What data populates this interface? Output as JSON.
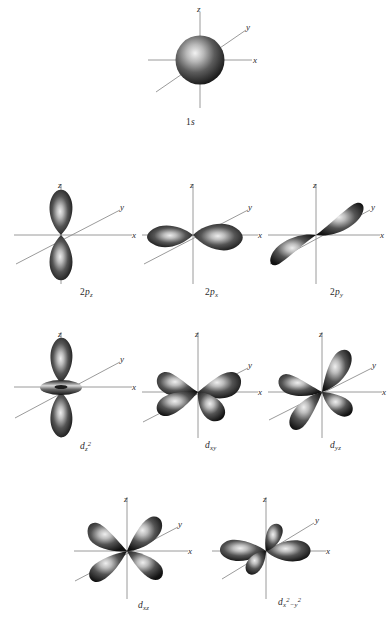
{
  "figure": {
    "background_color": "#ffffff",
    "axis_color": "#8a8a8a",
    "lobe_dark": "#1b1b1b",
    "lobe_mid": "#4a4a4a",
    "lobe_light": "#e8e8e8",
    "axis_labels": {
      "x": "x",
      "y": "y",
      "z": "z"
    }
  },
  "rows": [
    {
      "row_index": 0,
      "orbitals": [
        {
          "id": "1s",
          "shape": "sphere",
          "label_main": "1",
          "label_sub": "",
          "label_sup": "",
          "label_letter": "s",
          "label_text": "1s",
          "axes": [
            "z",
            "y",
            "x"
          ]
        }
      ]
    },
    {
      "row_index": 1,
      "orbitals": [
        {
          "id": "2pz",
          "shape": "dumbbell-vertical",
          "label_main": "2",
          "label_letter": "p",
          "label_sub": "z",
          "label_sup": "",
          "label_text": "2pz",
          "axes": [
            "z",
            "y",
            "x"
          ]
        },
        {
          "id": "2px",
          "shape": "dumbbell-horizontal",
          "label_main": "2",
          "label_letter": "p",
          "label_sub": "x",
          "label_sup": "",
          "label_text": "2px",
          "axes": [
            "z",
            "y",
            "x"
          ]
        },
        {
          "id": "2py",
          "shape": "dumbbell-diagonal",
          "label_main": "2",
          "label_letter": "p",
          "label_sub": "y",
          "label_sup": "",
          "label_text": "2py",
          "axes": [
            "z",
            "y",
            "x"
          ]
        }
      ]
    },
    {
      "row_index": 2,
      "orbitals": [
        {
          "id": "dz2",
          "shape": "dumbbell-torus",
          "label_main": "",
          "label_letter": "d",
          "label_sub": "z",
          "label_sup": "2",
          "label_text": "dz2",
          "axes": [
            "z",
            "y",
            "x"
          ]
        },
        {
          "id": "dxy",
          "shape": "cloverleaf-xy",
          "label_main": "",
          "label_letter": "d",
          "label_sub": "xy",
          "label_sup": "",
          "label_text": "dxy",
          "axes": [
            "z",
            "y",
            "x"
          ]
        },
        {
          "id": "dyz",
          "shape": "cloverleaf-yz",
          "label_main": "",
          "label_letter": "d",
          "label_sub": "yz",
          "label_sup": "",
          "label_text": "dyz",
          "axes": [
            "z",
            "y",
            "x"
          ]
        }
      ]
    },
    {
      "row_index": 3,
      "orbitals": [
        {
          "id": "dxz",
          "shape": "cloverleaf-xz",
          "label_main": "",
          "label_letter": "d",
          "label_sub": "xz",
          "label_sup": "",
          "label_text": "dxz",
          "axes": [
            "z",
            "y",
            "x"
          ]
        },
        {
          "id": "dx2y2",
          "shape": "cloverleaf-axial",
          "label_main": "",
          "label_letter": "d",
          "label_sub": "x",
          "label_sup": "2",
          "label_sub2": "−y",
          "label_sup2": "2",
          "label_text": "dx2-y2",
          "axes": [
            "z",
            "y",
            "x"
          ]
        }
      ]
    }
  ]
}
